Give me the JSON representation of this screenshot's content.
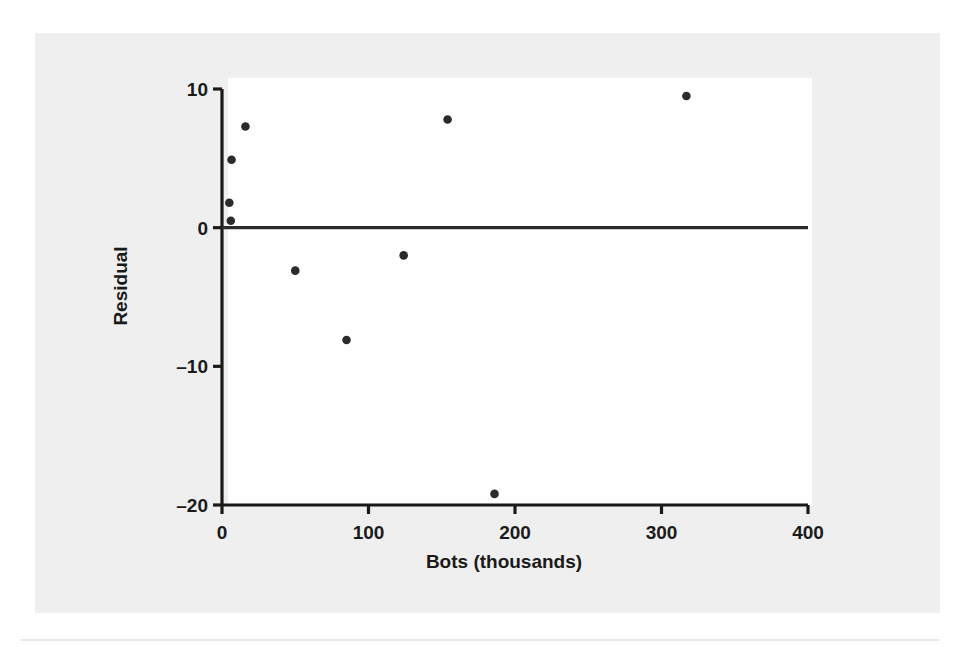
{
  "figure": {
    "background_color": "#efefef",
    "plot_background_color": "#ffffff",
    "axis_color": "#1a1a1a",
    "point_color": "#2b2b2b",
    "reference_line_color": "#2b2b2b"
  },
  "chart_data": {
    "type": "scatter",
    "title": "",
    "xlabel": "Bots (thousands)",
    "ylabel": "Residual",
    "xlim": [
      0,
      400
    ],
    "ylim": [
      -20,
      10
    ],
    "xticks": [
      0,
      100,
      200,
      300,
      400
    ],
    "xtick_labels": [
      "0",
      "100",
      "200",
      "300",
      "400"
    ],
    "yticks": [
      10,
      0,
      -10,
      -20
    ],
    "ytick_labels": [
      "10",
      "0",
      "–10",
      "–20"
    ],
    "grid": false,
    "legend": null,
    "reference_line": {
      "orientation": "horizontal",
      "y": 0,
      "label": ""
    },
    "x": [
      5,
      6,
      6.5,
      16,
      50,
      85,
      124,
      154,
      186,
      317
    ],
    "y": [
      1.8,
      0.5,
      4.9,
      7.3,
      -3.1,
      -8.1,
      -2.0,
      7.8,
      -19.2,
      9.5
    ],
    "points": [
      {
        "x": 5,
        "y": 1.8
      },
      {
        "x": 6,
        "y": 0.5
      },
      {
        "x": 6.5,
        "y": 4.9
      },
      {
        "x": 16,
        "y": 7.3
      },
      {
        "x": 50,
        "y": -3.1
      },
      {
        "x": 85,
        "y": -8.1
      },
      {
        "x": 124,
        "y": -2.0
      },
      {
        "x": 154,
        "y": 7.8
      },
      {
        "x": 186,
        "y": -19.2
      },
      {
        "x": 317,
        "y": 9.5
      }
    ]
  }
}
